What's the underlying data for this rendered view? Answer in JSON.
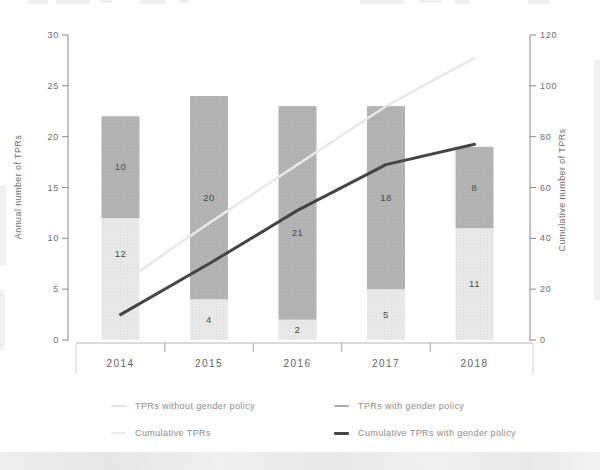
{
  "chart_data": {
    "type": "bar",
    "subtype": "stacked-bar-with-cumulative-lines",
    "categories": [
      "2014",
      "2015",
      "2016",
      "2017",
      "2018"
    ],
    "bar_series": [
      {
        "name": "TPRs without gender policy",
        "values": [
          12,
          4,
          2,
          5,
          11
        ],
        "color": "#e9e9e9"
      },
      {
        "name": "TPRs with gender policy",
        "values": [
          10,
          20,
          21,
          18,
          8
        ],
        "color": "#b4b4b4"
      }
    ],
    "line_series": [
      {
        "name": "Cumulative TPRs",
        "values": [
          22,
          46,
          69,
          92,
          111
        ],
        "color": "#e8e8e8",
        "stroke_width": 2.5
      },
      {
        "name": "Cumulative TPRs with gender policy",
        "values": [
          10,
          30,
          51,
          69,
          77
        ],
        "color": "#454545",
        "stroke_width": 3
      }
    ],
    "left_axis": {
      "label": "Annual number of TPRs",
      "min": 0,
      "max": 30,
      "ticks": [
        0,
        5,
        10,
        15,
        20,
        25,
        30
      ]
    },
    "right_axis": {
      "label": "Cumulative number of TPRs",
      "min": 0,
      "max": 120,
      "ticks": [
        0,
        20,
        40,
        60,
        80,
        100,
        120
      ]
    },
    "bar_value_labels_shown": true,
    "grid": false,
    "legend_position": "bottom",
    "colors": {
      "tick_text": "#6e6e6e",
      "year_text": "#5f5f5f",
      "bar_value_text": "#4a4a4a",
      "axis_line": "#8a8a8a",
      "x_baseline": "#b8b8b8",
      "x_inner_tick": "#a3a3a3",
      "x_end_tick": "#d0d0d0"
    }
  },
  "legend": {
    "items": [
      {
        "label": "TPRs without gender policy",
        "color": "#e3e3e3"
      },
      {
        "label": "TPRs with gender policy",
        "color": "#a9a9a9"
      },
      {
        "label": "Cumulative TPRs",
        "color": "#ececec"
      },
      {
        "label": "Cumulative TPRs with gender policy",
        "color": "#474747"
      }
    ]
  }
}
